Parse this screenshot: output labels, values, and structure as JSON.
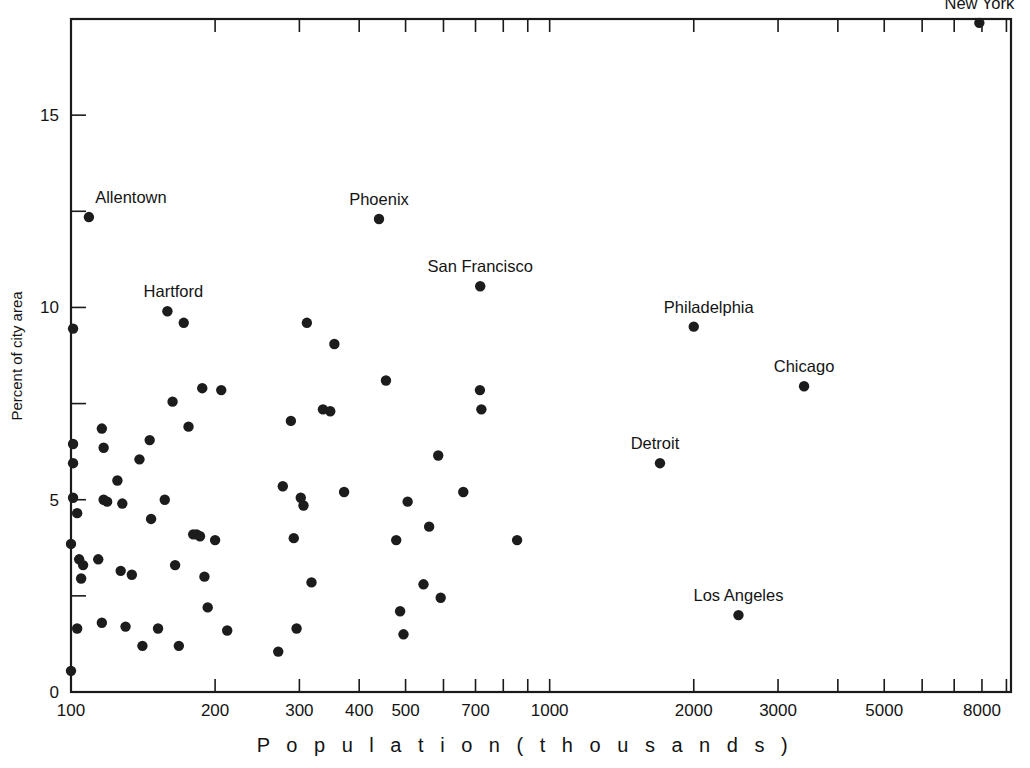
{
  "chart_data": {
    "type": "scatter",
    "title": "",
    "xlabel": "P o p u l a t i o n   ( t h o u s a n d s )",
    "ylabel": "Percent of city area",
    "xscale": "log",
    "yscale": "linear",
    "xlim": [
      100,
      9200
    ],
    "ylim": [
      0,
      17.5
    ],
    "grid": false,
    "legend": null,
    "x_tick_labels": [
      "100",
      "200",
      "300",
      "400",
      "500",
      "700",
      "1000",
      "2000",
      "3000",
      "5000",
      "8000"
    ],
    "x_tick_values": [
      100,
      200,
      300,
      400,
      500,
      700,
      1000,
      2000,
      3000,
      5000,
      8000
    ],
    "x_minor_tick_values": [
      600,
      800,
      900,
      4000,
      6000,
      7000,
      9000
    ],
    "y_tick_labels": [
      "0",
      "5",
      "10",
      "15"
    ],
    "y_tick_values": [
      0,
      5,
      10,
      15
    ],
    "y_minor_tick_values": [
      2.5,
      7.5,
      12.5
    ],
    "marker": "filled-circle",
    "marker_color": "#1c1c1c",
    "marker_size_px": 5.2,
    "labeled_points": [
      {
        "label": "New York",
        "x": 7900,
        "y": 17.4,
        "label_dx": 0,
        "label_dy": -14
      },
      {
        "label": "Allentown",
        "x": 109,
        "y": 12.35,
        "label_dx": 42,
        "label_dy": -14
      },
      {
        "label": "Phoenix",
        "x": 440,
        "y": 12.3,
        "label_dx": 0,
        "label_dy": -14
      },
      {
        "label": "San Francisco",
        "x": 716,
        "y": 10.55,
        "label_dx": 0,
        "label_dy": -14
      },
      {
        "label": "Hartford",
        "x": 159,
        "y": 9.9,
        "label_dx": 6,
        "label_dy": -14
      },
      {
        "label": "Philadelphia",
        "x": 2000,
        "y": 9.5,
        "label_dx": 15,
        "label_dy": -14
      },
      {
        "label": "Chicago",
        "x": 3400,
        "y": 7.95,
        "label_dx": 0,
        "label_dy": -14
      },
      {
        "label": "Detroit",
        "x": 1700,
        "y": 5.95,
        "label_dx": -5,
        "label_dy": -14
      },
      {
        "label": "Los Angeles",
        "x": 2480,
        "y": 2.0,
        "label_dx": 0,
        "label_dy": -14
      }
    ],
    "unlabeled_points": [
      {
        "x": 101,
        "y": 9.45
      },
      {
        "x": 101,
        "y": 6.45
      },
      {
        "x": 101,
        "y": 5.95
      },
      {
        "x": 101,
        "y": 5.05
      },
      {
        "x": 103,
        "y": 4.65
      },
      {
        "x": 100,
        "y": 3.85
      },
      {
        "x": 104,
        "y": 3.45
      },
      {
        "x": 106,
        "y": 3.3
      },
      {
        "x": 105,
        "y": 2.95
      },
      {
        "x": 103,
        "y": 1.65
      },
      {
        "x": 100,
        "y": 0.55
      },
      {
        "x": 116,
        "y": 6.85
      },
      {
        "x": 117,
        "y": 6.35
      },
      {
        "x": 117,
        "y": 5.0
      },
      {
        "x": 119,
        "y": 4.95
      },
      {
        "x": 114,
        "y": 3.45
      },
      {
        "x": 116,
        "y": 1.8
      },
      {
        "x": 125,
        "y": 5.5
      },
      {
        "x": 128,
        "y": 4.9
      },
      {
        "x": 127,
        "y": 3.15
      },
      {
        "x": 130,
        "y": 1.7
      },
      {
        "x": 134,
        "y": 3.05
      },
      {
        "x": 139,
        "y": 6.05
      },
      {
        "x": 141,
        "y": 1.2
      },
      {
        "x": 146,
        "y": 6.55
      },
      {
        "x": 147,
        "y": 4.5
      },
      {
        "x": 152,
        "y": 1.65
      },
      {
        "x": 157,
        "y": 5.0
      },
      {
        "x": 163,
        "y": 7.55
      },
      {
        "x": 165,
        "y": 3.3
      },
      {
        "x": 168,
        "y": 1.2
      },
      {
        "x": 172,
        "y": 9.6
      },
      {
        "x": 176,
        "y": 6.9
      },
      {
        "x": 180,
        "y": 4.1
      },
      {
        "x": 183,
        "y": 4.1
      },
      {
        "x": 186,
        "y": 4.05
      },
      {
        "x": 188,
        "y": 7.9
      },
      {
        "x": 190,
        "y": 3.0
      },
      {
        "x": 193,
        "y": 2.2
      },
      {
        "x": 200,
        "y": 3.95
      },
      {
        "x": 206,
        "y": 7.85
      },
      {
        "x": 212,
        "y": 1.6
      },
      {
        "x": 271,
        "y": 1.05
      },
      {
        "x": 277,
        "y": 5.35
      },
      {
        "x": 288,
        "y": 7.05
      },
      {
        "x": 292,
        "y": 4.0
      },
      {
        "x": 296,
        "y": 1.65
      },
      {
        "x": 302,
        "y": 5.05
      },
      {
        "x": 306,
        "y": 4.85
      },
      {
        "x": 311,
        "y": 9.6
      },
      {
        "x": 318,
        "y": 2.85
      },
      {
        "x": 336,
        "y": 7.35
      },
      {
        "x": 348,
        "y": 7.3
      },
      {
        "x": 355,
        "y": 9.05
      },
      {
        "x": 372,
        "y": 5.2
      },
      {
        "x": 455,
        "y": 8.1
      },
      {
        "x": 478,
        "y": 3.95
      },
      {
        "x": 487,
        "y": 2.1
      },
      {
        "x": 495,
        "y": 1.5
      },
      {
        "x": 505,
        "y": 4.95
      },
      {
        "x": 545,
        "y": 2.8
      },
      {
        "x": 560,
        "y": 4.3
      },
      {
        "x": 585,
        "y": 6.15
      },
      {
        "x": 592,
        "y": 2.45
      },
      {
        "x": 660,
        "y": 5.2
      },
      {
        "x": 715,
        "y": 7.85
      },
      {
        "x": 720,
        "y": 7.35
      },
      {
        "x": 855,
        "y": 3.95
      }
    ]
  },
  "figure": {
    "background_color": "#ffffff",
    "axis_color": "#1a1a1a"
  }
}
